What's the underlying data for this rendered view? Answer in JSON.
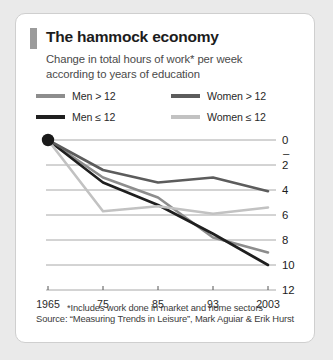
{
  "card": {
    "title": "The hammock economy",
    "subtitle_line1": "Change in total hours of work* per week",
    "subtitle_line2": "according to years of education",
    "accent_bar_color": "#9b9b9b",
    "border_color": "#cfcfcf",
    "background_color": "#ffffff"
  },
  "legend": {
    "position": "above-plot",
    "items": [
      {
        "label": "Men > 12",
        "color": "#8d8d8d"
      },
      {
        "label": "Women > 12",
        "color": "#5c5c5c"
      },
      {
        "label": "Men ≤ 12",
        "color": "#1f1f1f"
      },
      {
        "label": "Women ≤ 12",
        "color": "#c2c2c2"
      }
    ]
  },
  "footnote": {
    "note": "*Includes work done in market and home sectors",
    "source": "Source: “Measuring Trends in Leisure”, Mark Aguiar & Erik Hurst"
  },
  "origin_marker": {
    "name": "origin-dot",
    "x": "1965",
    "y": 0,
    "color": "#1a1a1a"
  },
  "chart_data": {
    "type": "line",
    "title": "The hammock economy",
    "subtitle": "Change in total hours of work* per week according to years of education",
    "xlabel": "",
    "ylabel": "",
    "categories": [
      "1965",
      "75",
      "85",
      "93",
      "2003"
    ],
    "x_tick_labels": [
      "1965",
      "75",
      "85",
      "93",
      "2003"
    ],
    "y_tick_labels": [
      "0",
      "2",
      "4",
      "6",
      "8",
      "10",
      "12"
    ],
    "y_tick_values": [
      0,
      -2,
      -4,
      -6,
      -8,
      -10,
      -12
    ],
    "y_axis_note": "values are negative (hours decrease); axis labelled with magnitudes, minus sign shown above 2",
    "minus_hint_label": "–",
    "ylim": [
      -12,
      0
    ],
    "inverted_y": true,
    "grid": true,
    "grid_color": "#a8a8a8",
    "legend_position": "top",
    "series": [
      {
        "name": "Men > 12",
        "color": "#8d8d8d",
        "values": [
          0,
          -3.0,
          -4.6,
          -7.8,
          -9.0
        ]
      },
      {
        "name": "Men ≤ 12",
        "color": "#1f1f1f",
        "values": [
          0,
          -3.4,
          -5.2,
          -7.5,
          -10.0
        ]
      },
      {
        "name": "Women > 12",
        "color": "#5c5c5c",
        "values": [
          0,
          -2.4,
          -3.4,
          -3.0,
          -4.1
        ]
      },
      {
        "name": "Women ≤ 12",
        "color": "#c2c2c2",
        "values": [
          0,
          -5.7,
          -5.3,
          -5.9,
          -5.4
        ]
      }
    ]
  }
}
